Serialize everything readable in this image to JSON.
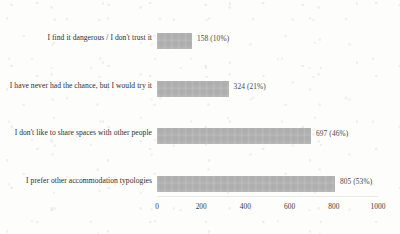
{
  "chart_data": {
    "type": "bar",
    "orientation": "horizontal",
    "title": "",
    "subtitle": "",
    "xlabel": "",
    "ylabel": "",
    "categories": [
      "I find it dangerous / I don't trust it",
      "I have never had the chance, but I would try it",
      "I don't like to share spaces with other people",
      "I prefer other accommodation typologies"
    ],
    "values": [
      158,
      324,
      697,
      805
    ],
    "percents": [
      "10%",
      "21%",
      "46%",
      "53%"
    ],
    "data_labels": [
      "158 (10%)",
      "324 (21%)",
      "697 (46%)",
      "805 (53%)"
    ],
    "xlim": [
      0,
      1000
    ],
    "xticks": [
      0,
      200,
      400,
      600,
      800,
      1000
    ],
    "xtick_labels": [
      "0",
      "200",
      "400",
      "600",
      "800",
      "1000"
    ],
    "grid": false,
    "legend": false,
    "bar_color": "#b2b2b2",
    "text_color": "#2e2e2e",
    "background_color": "#fdfdfc"
  }
}
